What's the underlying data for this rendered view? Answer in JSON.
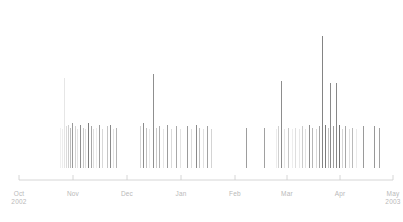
{
  "chart_data": {
    "type": "bar",
    "title": "",
    "subtitle": "",
    "xlabel": "",
    "ylabel": "",
    "grid": false,
    "legend": null,
    "axis": {
      "orientation": "horizontal",
      "line_color": "#cccccc",
      "tick_direction": "up",
      "tick_length": 5,
      "range_start": "Oct 2002",
      "range_end": "May 2003"
    },
    "tick_labels": [
      {
        "month": "Oct",
        "year": "2002",
        "x_px": 19
      },
      {
        "month": "Nov",
        "year": "",
        "x_px": 73
      },
      {
        "month": "Dec",
        "year": "",
        "x_px": 127
      },
      {
        "month": "Jan",
        "year": "",
        "x_px": 181
      },
      {
        "month": "Feb",
        "year": "",
        "x_px": 235
      },
      {
        "month": "Mar",
        "year": "",
        "x_px": 287
      },
      {
        "month": "Apr",
        "year": "",
        "x_px": 340
      },
      {
        "month": "May",
        "year": "2003",
        "x_px": 393
      }
    ],
    "ylim": [
      0,
      100
    ],
    "value_unit": "relative",
    "bar_color_range": [
      "#f2f2f2",
      "#6e6e6e"
    ],
    "series": [
      {
        "name": "activity",
        "bars": [
          {
            "x": 60,
            "w": 1.2,
            "v": 27,
            "c": "#f0f0f0"
          },
          {
            "x": 62,
            "w": 1.0,
            "v": 26,
            "c": "#ededed"
          },
          {
            "x": 64,
            "w": 1.4,
            "v": 60,
            "c": "#e6e6e6"
          },
          {
            "x": 66,
            "w": 1.0,
            "v": 28,
            "c": "#dcdcdc"
          },
          {
            "x": 68,
            "w": 1.2,
            "v": 29,
            "c": "#cfcfcf"
          },
          {
            "x": 70,
            "w": 1.0,
            "v": 27,
            "c": "#bdbdbd"
          },
          {
            "x": 72,
            "w": 1.4,
            "v": 30,
            "c": "#9a9a9a"
          },
          {
            "x": 75,
            "w": 1.2,
            "v": 28,
            "c": "#d2d2d2"
          },
          {
            "x": 77,
            "w": 1.0,
            "v": 26,
            "c": "#e4e4e4"
          },
          {
            "x": 80,
            "w": 1.4,
            "v": 29,
            "c": "#8e8e8e"
          },
          {
            "x": 83,
            "w": 1.2,
            "v": 27,
            "c": "#c8c8c8"
          },
          {
            "x": 85,
            "w": 1.0,
            "v": 26,
            "c": "#e0e0e0"
          },
          {
            "x": 88,
            "w": 1.4,
            "v": 30,
            "c": "#7e7e7e"
          },
          {
            "x": 91,
            "w": 1.2,
            "v": 28,
            "c": "#a6a6a6"
          },
          {
            "x": 93,
            "w": 1.0,
            "v": 26,
            "c": "#dedede"
          },
          {
            "x": 96,
            "w": 1.2,
            "v": 27,
            "c": "#ececec"
          },
          {
            "x": 99,
            "w": 1.4,
            "v": 29,
            "c": "#9e9e9e"
          },
          {
            "x": 102,
            "w": 1.0,
            "v": 26,
            "c": "#d8d8d8"
          },
          {
            "x": 107,
            "w": 1.2,
            "v": 28,
            "c": "#c4c4c4"
          },
          {
            "x": 110,
            "w": 1.4,
            "v": 29,
            "c": "#8a8a8a"
          },
          {
            "x": 113,
            "w": 1.0,
            "v": 26,
            "c": "#e2e2e2"
          },
          {
            "x": 116,
            "w": 1.2,
            "v": 27,
            "c": "#b4b4b4"
          },
          {
            "x": 140,
            "w": 1.2,
            "v": 28,
            "c": "#d6d6d6"
          },
          {
            "x": 143,
            "w": 1.4,
            "v": 30,
            "c": "#8c8c8c"
          },
          {
            "x": 146,
            "w": 1.0,
            "v": 27,
            "c": "#c0c0c0"
          },
          {
            "x": 149,
            "w": 1.2,
            "v": 26,
            "c": "#e8e8e8"
          },
          {
            "x": 153,
            "w": 1.4,
            "v": 63,
            "c": "#8f8f8f"
          },
          {
            "x": 156,
            "w": 1.0,
            "v": 27,
            "c": "#cacaca"
          },
          {
            "x": 159,
            "w": 1.2,
            "v": 28,
            "c": "#b0b0b0"
          },
          {
            "x": 163,
            "w": 1.0,
            "v": 26,
            "c": "#e6e6e6"
          },
          {
            "x": 167,
            "w": 1.4,
            "v": 29,
            "c": "#9c9c9c"
          },
          {
            "x": 171,
            "w": 1.0,
            "v": 26,
            "c": "#dadada"
          },
          {
            "x": 176,
            "w": 1.2,
            "v": 28,
            "c": "#a8a8a8"
          },
          {
            "x": 180,
            "w": 1.0,
            "v": 26,
            "c": "#e4e4e4"
          },
          {
            "x": 187,
            "w": 1.2,
            "v": 28,
            "c": "#9b9b9b"
          },
          {
            "x": 191,
            "w": 1.0,
            "v": 26,
            "c": "#dcdcdc"
          },
          {
            "x": 196,
            "w": 1.4,
            "v": 29,
            "c": "#8b8b8b"
          },
          {
            "x": 199,
            "w": 1.2,
            "v": 27,
            "c": "#bfbfbf"
          },
          {
            "x": 203,
            "w": 1.0,
            "v": 26,
            "c": "#e1e1e1"
          },
          {
            "x": 207,
            "w": 1.2,
            "v": 28,
            "c": "#a2a2a2"
          },
          {
            "x": 211,
            "w": 1.0,
            "v": 26,
            "c": "#d4d4d4"
          },
          {
            "x": 246,
            "w": 1.2,
            "v": 27,
            "c": "#9d9d9d"
          },
          {
            "x": 264,
            "w": 1.2,
            "v": 27,
            "c": "#a0a0a0"
          },
          {
            "x": 276,
            "w": 1.0,
            "v": 26,
            "c": "#ececec"
          },
          {
            "x": 278,
            "w": 1.2,
            "v": 28,
            "c": "#d0d0d0"
          },
          {
            "x": 281,
            "w": 1.4,
            "v": 58,
            "c": "#8d8d8d"
          },
          {
            "x": 284,
            "w": 1.0,
            "v": 26,
            "c": "#e6e6e6"
          },
          {
            "x": 288,
            "w": 1.2,
            "v": 27,
            "c": "#c6c6c6"
          },
          {
            "x": 292,
            "w": 1.0,
            "v": 26,
            "c": "#ededed"
          },
          {
            "x": 295,
            "w": 1.2,
            "v": 27,
            "c": "#dedede"
          },
          {
            "x": 299,
            "w": 1.0,
            "v": 26,
            "c": "#e8e8e8"
          },
          {
            "x": 302,
            "w": 1.2,
            "v": 28,
            "c": "#cccccc"
          },
          {
            "x": 305,
            "w": 1.0,
            "v": 26,
            "c": "#e2e2e2"
          },
          {
            "x": 309,
            "w": 1.4,
            "v": 29,
            "c": "#8f8f8f"
          },
          {
            "x": 312,
            "w": 1.2,
            "v": 27,
            "c": "#b6b6b6"
          },
          {
            "x": 316,
            "w": 1.0,
            "v": 26,
            "c": "#d8d8d8"
          },
          {
            "x": 319,
            "w": 1.2,
            "v": 28,
            "c": "#a4a4a4"
          },
          {
            "x": 322,
            "w": 1.4,
            "v": 88,
            "c": "#848484"
          },
          {
            "x": 325,
            "w": 1.2,
            "v": 29,
            "c": "#7c7c7c"
          },
          {
            "x": 328,
            "w": 1.0,
            "v": 27,
            "c": "#c2c2c2"
          },
          {
            "x": 330,
            "w": 1.4,
            "v": 57,
            "c": "#8a8a8a"
          },
          {
            "x": 333,
            "w": 1.2,
            "v": 28,
            "c": "#9e9e9e"
          },
          {
            "x": 336,
            "w": 1.4,
            "v": 57,
            "c": "#888888"
          },
          {
            "x": 339,
            "w": 1.2,
            "v": 29,
            "c": "#767676"
          },
          {
            "x": 342,
            "w": 1.0,
            "v": 26,
            "c": "#d6d6d6"
          },
          {
            "x": 345,
            "w": 1.2,
            "v": 28,
            "c": "#a8a8a8"
          },
          {
            "x": 349,
            "w": 1.0,
            "v": 26,
            "c": "#e0e0e0"
          },
          {
            "x": 352,
            "w": 1.2,
            "v": 27,
            "c": "#bababa"
          },
          {
            "x": 356,
            "w": 1.0,
            "v": 26,
            "c": "#eaeaea"
          },
          {
            "x": 363,
            "w": 1.2,
            "v": 28,
            "c": "#9a9a9a"
          },
          {
            "x": 374,
            "w": 1.2,
            "v": 28,
            "c": "#989898"
          },
          {
            "x": 379,
            "w": 1.2,
            "v": 27,
            "c": "#a2a2a2"
          }
        ]
      }
    ]
  }
}
